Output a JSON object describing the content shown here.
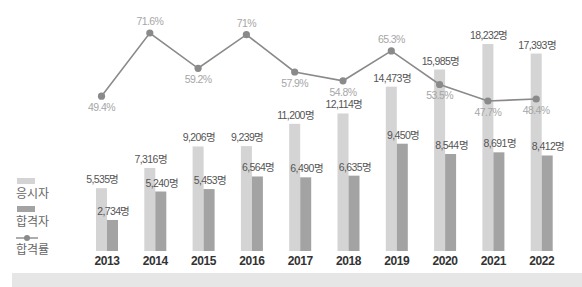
{
  "chart_data": {
    "type": "bar",
    "title": "",
    "xlabel": "",
    "ylabel": "",
    "categories": [
      "2013",
      "2014",
      "2015",
      "2016",
      "2017",
      "2018",
      "2019",
      "2020",
      "2021",
      "2022"
    ],
    "series": [
      {
        "name": "응시자",
        "type": "bar",
        "color": "#d4d4d4",
        "values": [
          5535,
          7316,
          9206,
          9239,
          11200,
          12114,
          14473,
          15985,
          18232,
          17393
        ],
        "labels": [
          "5,535명",
          "7,316명",
          "9,206명",
          "9,239명",
          "11,200명",
          "12,114명",
          "14,473명",
          "15,985명",
          "18,232명",
          "17,393명"
        ]
      },
      {
        "name": "합격자",
        "type": "bar",
        "color": "#a3a3a3",
        "values": [
          2734,
          5240,
          5453,
          6564,
          6490,
          6635,
          9450,
          8544,
          8691,
          8412
        ],
        "labels": [
          "2,734명",
          "5,240명",
          "5,453명",
          "6,564명",
          "6,490명",
          "6,635명",
          "9,450명",
          "8,544명",
          "8,691명",
          "8,412명"
        ]
      },
      {
        "name": "합격률",
        "type": "line",
        "color": "#8a8a8a",
        "values": [
          49.4,
          71.6,
          59.2,
          71.0,
          57.9,
          54.8,
          65.3,
          53.5,
          47.7,
          48.4
        ],
        "labels": [
          "49.4%",
          "71.6%",
          "59.2%",
          "71%",
          "57.9%",
          "54.8%",
          "65.3%",
          "53.5%",
          "47.7%",
          "48.4%"
        ]
      }
    ],
    "legend": {
      "position": "left",
      "entries": [
        "응시자",
        "합격자",
        "합격률"
      ]
    },
    "grid": false,
    "ylim": [
      0,
      20000
    ]
  },
  "legend": {
    "applicants": "응시자",
    "passers": "합격자",
    "pass_rate": "합격률"
  }
}
